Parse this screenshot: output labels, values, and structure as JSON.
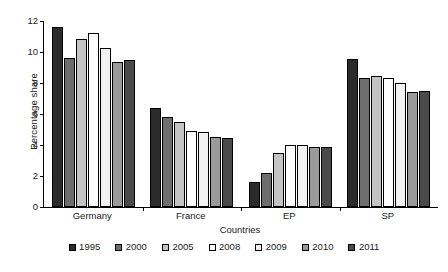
{
  "chart_data": {
    "type": "bar",
    "title": "",
    "xlabel": "Countries",
    "ylabel": "Percentage share",
    "categories": [
      "Germany",
      "France",
      "EP",
      "SP"
    ],
    "ylim": [
      0,
      12
    ],
    "yticks": [
      0,
      2,
      4,
      6,
      8,
      10,
      12
    ],
    "grid": false,
    "legend_position": "bottom",
    "series": [
      {
        "name": "1995",
        "color": "#2b2b2b",
        "values": [
          11.6,
          6.4,
          1.6,
          9.55
        ]
      },
      {
        "name": "2000",
        "color": "#6e6e6e",
        "values": [
          9.6,
          5.8,
          2.2,
          8.3
        ]
      },
      {
        "name": "2005",
        "color": "#c4c4c4",
        "values": [
          10.85,
          5.5,
          3.5,
          8.45
        ]
      },
      {
        "name": "2008",
        "color": "#ffffff",
        "values": [
          11.25,
          4.9,
          4.0,
          8.3
        ]
      },
      {
        "name": "2009",
        "color": "#f2f2f2",
        "values": [
          10.25,
          4.85,
          4.0,
          8.0
        ]
      },
      {
        "name": "2010",
        "color": "#9a9a9a",
        "values": [
          9.35,
          4.5,
          3.9,
          7.4
        ]
      },
      {
        "name": "2011",
        "color": "#4a4a4a",
        "values": [
          9.5,
          4.45,
          3.85,
          7.5
        ]
      }
    ]
  }
}
